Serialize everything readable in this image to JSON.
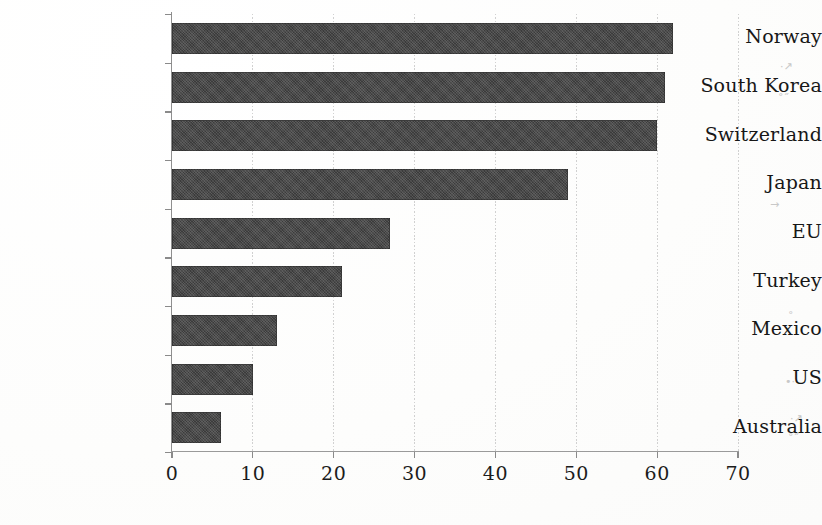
{
  "chart_data": {
    "type": "bar",
    "orientation": "horizontal",
    "title": "",
    "subtitle": "",
    "xlabel": "",
    "ylabel": "",
    "categories": [
      "Norway",
      "South Korea",
      "Switzerland",
      "Japan",
      "EU",
      "Turkey",
      "Mexico",
      "US",
      "Australia"
    ],
    "values": [
      62,
      61,
      60,
      49,
      27,
      21,
      13,
      10,
      6
    ],
    "xlim": [
      0,
      70
    ],
    "xticks": [
      0,
      10,
      20,
      30,
      40,
      50,
      60,
      70
    ],
    "xtick_labels": [
      "0",
      "10",
      "20",
      "30",
      "40",
      "50",
      "60",
      "70"
    ],
    "grid": "vertical-dotted",
    "legend": "none",
    "bar_color": "#3b3b3b",
    "axis_color": "#8f8f8f",
    "gridline_color": "#c9c9c9",
    "background_color": "#fefefe",
    "text_color": "#171717"
  },
  "artifacts": {
    "specks": [
      "·↗",
      "˚˝",
      "→",
      "˚",
      "•·"
    ]
  }
}
